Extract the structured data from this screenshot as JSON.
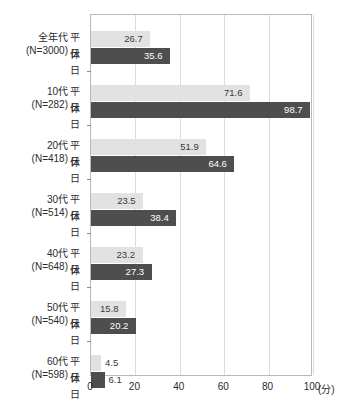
{
  "chart_data": {
    "type": "bar",
    "orientation": "horizontal",
    "title": "",
    "xlabel": "(分)",
    "ylabel": "",
    "xlim": [
      0,
      100
    ],
    "xticks": [
      0,
      20,
      40,
      60,
      80,
      100
    ],
    "grid": true,
    "legend_position": "none",
    "categories": [
      "全年代",
      "10代",
      "20代",
      "30代",
      "40代",
      "50代",
      "60代"
    ],
    "category_sublabels": [
      "(N=3000)",
      "(N=282)",
      "(N=418)",
      "(N=514)",
      "(N=648)",
      "(N=540)",
      "(N=598)"
    ],
    "series": [
      {
        "name": "平日",
        "color": "#e2e2e2",
        "values": [
          26.7,
          71.6,
          51.9,
          23.5,
          23.2,
          15.8,
          4.5
        ]
      },
      {
        "name": "休日",
        "color": "#4e4e4e",
        "values": [
          35.6,
          98.7,
          64.6,
          38.4,
          27.3,
          20.2,
          6.1
        ]
      }
    ]
  },
  "axis": {
    "unit_label": "(分)",
    "tick_labels": [
      "0",
      "20",
      "40",
      "60",
      "80",
      "100"
    ]
  },
  "groups": [
    {
      "label": "全年代",
      "n": "(N=3000)",
      "rows": [
        {
          "series": "平日",
          "value": "26.7"
        },
        {
          "series": "休日",
          "value": "35.6"
        }
      ]
    },
    {
      "label": "10代",
      "n": "(N=282)",
      "rows": [
        {
          "series": "平日",
          "value": "71.6"
        },
        {
          "series": "休日",
          "value": "98.7"
        }
      ]
    },
    {
      "label": "20代",
      "n": "(N=418)",
      "rows": [
        {
          "series": "平日",
          "value": "51.9"
        },
        {
          "series": "休日",
          "value": "64.6"
        }
      ]
    },
    {
      "label": "30代",
      "n": "(N=514)",
      "rows": [
        {
          "series": "平日",
          "value": "23.5"
        },
        {
          "series": "休日",
          "value": "38.4"
        }
      ]
    },
    {
      "label": "40代",
      "n": "(N=648)",
      "rows": [
        {
          "series": "平日",
          "value": "23.2"
        },
        {
          "series": "休日",
          "value": "27.3"
        }
      ]
    },
    {
      "label": "50代",
      "n": "(N=540)",
      "rows": [
        {
          "series": "平日",
          "value": "15.8"
        },
        {
          "series": "休日",
          "value": "20.2"
        }
      ]
    },
    {
      "label": "60代",
      "n": "(N=598)",
      "rows": [
        {
          "series": "平日",
          "value": "4.5"
        },
        {
          "series": "休日",
          "value": "6.1"
        }
      ]
    }
  ],
  "colors": {
    "weekday_bar": "#e2e2e2",
    "holiday_bar": "#4e4e4e",
    "gridline": "#dcdcdc",
    "plot_border": "#b9b9b9",
    "text": "#2b2b2b"
  }
}
